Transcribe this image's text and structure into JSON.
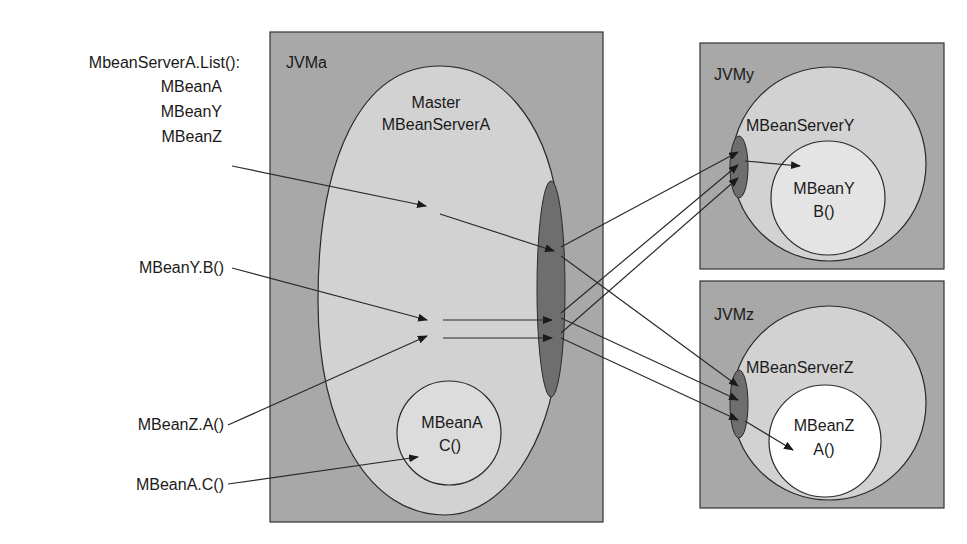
{
  "left_labels": {
    "list_call": "MbeanServerA.List():",
    "list_items": [
      "MBeanA",
      "MBeanY",
      "MBeanZ"
    ],
    "call_b": "MBeanY.B()",
    "call_a": "MBeanZ.A()",
    "call_c": "MBeanA.C()"
  },
  "jvm_a": {
    "title": "JVMa",
    "server_line1": "Master",
    "server_line2": "MBeanServerA",
    "bean_name": "MBeanA",
    "bean_method": "C()"
  },
  "jvm_y": {
    "title": "JVMy",
    "server": "MBeanServerY",
    "bean_name": "MBeanY",
    "bean_method": "B()"
  },
  "jvm_z": {
    "title": "JVMz",
    "server": "MBeanServerZ",
    "bean_name": "MBeanZ",
    "bean_method": "A()"
  },
  "colors": {
    "box": "#a8a8a8",
    "server": "#d2d2d2",
    "connector": "#6e6e6e",
    "mbean_a": "#dcdcdc",
    "mbean_y": "#e4e4e4",
    "mbean_z": "#ffffff",
    "line": "#2a2a2a"
  }
}
